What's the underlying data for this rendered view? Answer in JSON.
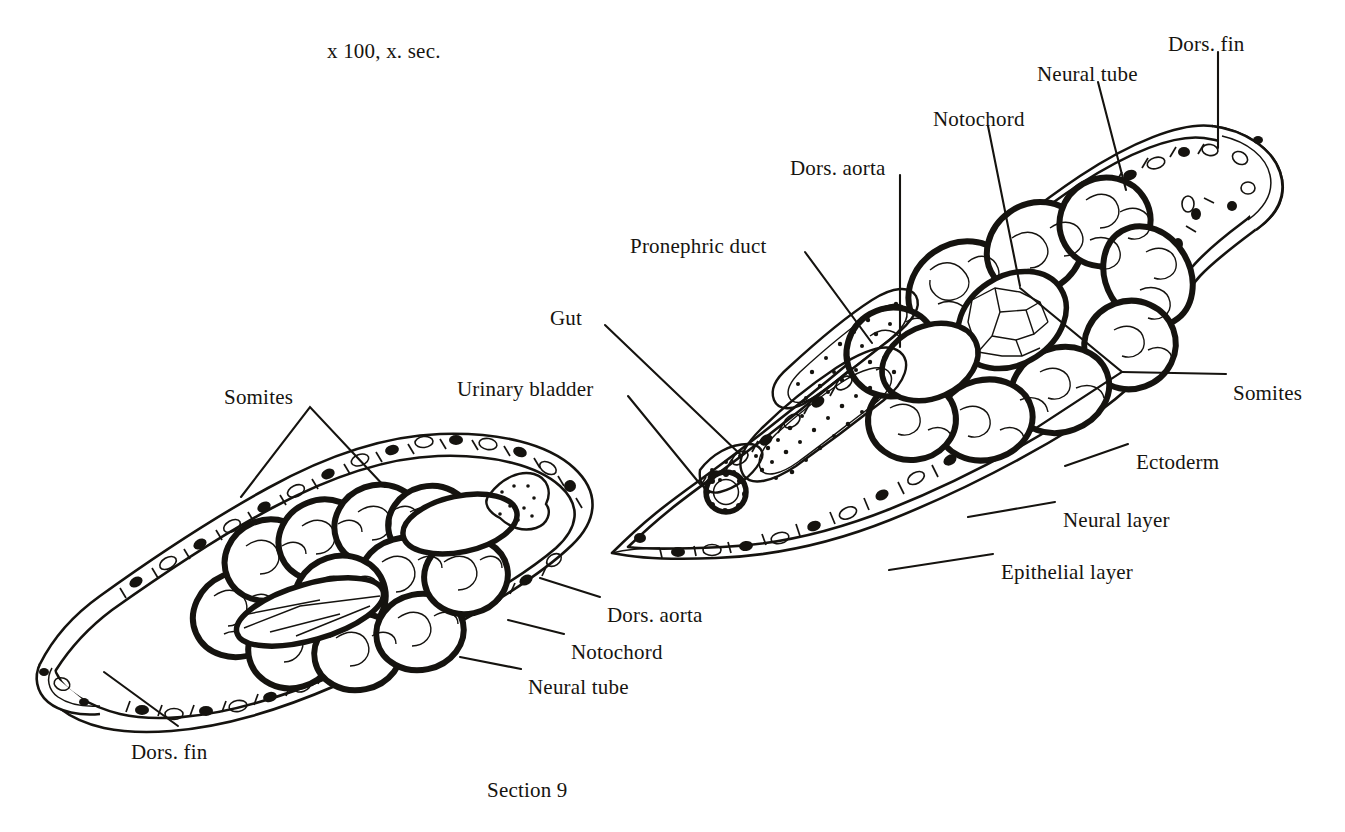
{
  "figure": {
    "magnification_note": "x 100, x. sec.",
    "caption": "Section 9",
    "type": "histological-cross-section",
    "ink_color": "#15130f",
    "background_color": "#ffffff"
  },
  "labels": [
    {
      "id": "dors-fin-top",
      "text": "Dors. fin",
      "x": 1168,
      "y": 33,
      "align": "left"
    },
    {
      "id": "neural-tube-top",
      "text": "Neural tube",
      "x": 1037,
      "y": 63,
      "align": "left"
    },
    {
      "id": "notochord-top",
      "text": "Notochord",
      "x": 933,
      "y": 108,
      "align": "left"
    },
    {
      "id": "dors-aorta-top",
      "text": "Dors. aorta",
      "x": 790,
      "y": 157,
      "align": "left"
    },
    {
      "id": "pronephric-duct",
      "text": "Pronephric duct",
      "x": 630,
      "y": 235,
      "align": "left"
    },
    {
      "id": "gut",
      "text": "Gut",
      "x": 550,
      "y": 307,
      "align": "left"
    },
    {
      "id": "urinary-bladder",
      "text": "Urinary bladder",
      "x": 457,
      "y": 378,
      "align": "left"
    },
    {
      "id": "somites-left",
      "text": "Somites",
      "x": 224,
      "y": 386,
      "align": "left"
    },
    {
      "id": "somites-right",
      "text": "Somites",
      "x": 1233,
      "y": 382,
      "align": "left"
    },
    {
      "id": "ectoderm",
      "text": "Ectoderm",
      "x": 1136,
      "y": 451,
      "align": "left"
    },
    {
      "id": "neural-layer",
      "text": "Neural layer",
      "x": 1063,
      "y": 509,
      "align": "left"
    },
    {
      "id": "epithelial-layer",
      "text": "Epithelial layer",
      "x": 1001,
      "y": 561,
      "align": "left"
    },
    {
      "id": "dors-aorta-bottom",
      "text": "Dors. aorta",
      "x": 607,
      "y": 604,
      "align": "left"
    },
    {
      "id": "notochord-bottom",
      "text": "Notochord",
      "x": 571,
      "y": 641,
      "align": "left"
    },
    {
      "id": "neural-tube-bottom",
      "text": "Neural tube",
      "x": 528,
      "y": 676,
      "align": "left"
    },
    {
      "id": "dors-fin-bottom",
      "text": "Dors. fin",
      "x": 131,
      "y": 741,
      "align": "left"
    }
  ],
  "structures": [
    "dorsal fin",
    "neural tube",
    "notochord",
    "dorsal aorta",
    "pronephric duct",
    "gut",
    "urinary bladder",
    "somites",
    "ectoderm",
    "neural layer",
    "epithelial layer"
  ]
}
